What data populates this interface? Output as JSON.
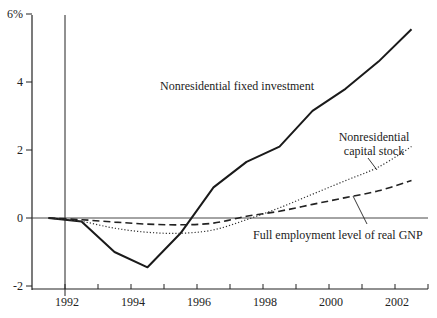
{
  "chart_data": {
    "type": "line",
    "title": "",
    "xlabel": "",
    "ylabel": "",
    "y_unit": "%",
    "ylim": [
      -2,
      6
    ],
    "xlim": [
      1991,
      2003
    ],
    "grid": false,
    "legend_position": "inline annotations",
    "y_ticks": [
      {
        "value": 6,
        "label": "6%"
      },
      {
        "value": 4,
        "label": "4"
      },
      {
        "value": 2,
        "label": "2"
      },
      {
        "value": 0,
        "label": "0"
      },
      {
        "value": -2,
        "label": "-2"
      }
    ],
    "x_tick_labels": [
      "1992",
      "1994",
      "1996",
      "1998",
      "2000",
      "2002"
    ],
    "x": [
      1991.5,
      1992.5,
      1993.5,
      1994.5,
      1995.5,
      1996.5,
      1997.5,
      1998.5,
      1999.5,
      2000.5,
      2001.5,
      2002.5
    ],
    "series": [
      {
        "name": "Nonresidential fixed investment",
        "style": "solid",
        "values": [
          0.0,
          -0.1,
          -1.0,
          -1.45,
          -0.45,
          0.9,
          1.65,
          2.1,
          3.15,
          3.8,
          4.6,
          5.55
        ]
      },
      {
        "name": "Nonresidential capital stock",
        "style": "dotted",
        "values": [
          0.0,
          -0.1,
          -0.3,
          -0.42,
          -0.45,
          -0.35,
          -0.05,
          0.3,
          0.7,
          1.1,
          1.5,
          2.1
        ]
      },
      {
        "name": "Full employment level of real GNP",
        "style": "dashed",
        "values": [
          0.0,
          -0.05,
          -0.12,
          -0.18,
          -0.2,
          -0.15,
          0.05,
          0.2,
          0.4,
          0.6,
          0.8,
          1.1
        ]
      }
    ],
    "annotations": [
      {
        "text": "Nonresidential fixed investment",
        "series": "Nonresidential fixed investment"
      },
      {
        "text": "Nonresidential",
        "series": "Nonresidential capital stock"
      },
      {
        "text": "capital stock",
        "series": "Nonresidential capital stock"
      },
      {
        "text": "Full employment level of real GNP",
        "series": "Full employment level of real GNP"
      }
    ]
  }
}
